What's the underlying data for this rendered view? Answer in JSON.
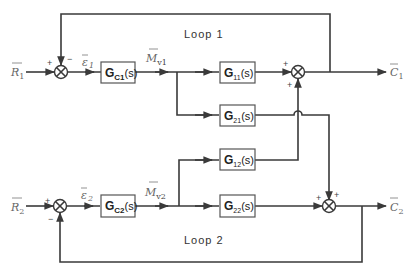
{
  "diagram": {
    "loops": [
      {
        "label": "Loop 1"
      },
      {
        "label": "Loop 2"
      }
    ],
    "inputs": [
      {
        "symbol": "R",
        "subscript": "1"
      },
      {
        "symbol": "R",
        "subscript": "2"
      }
    ],
    "outputs": [
      {
        "symbol": "C",
        "subscript": "1"
      },
      {
        "symbol": "C",
        "subscript": "2"
      }
    ],
    "errors": [
      {
        "symbol": "ε",
        "subscript": "1"
      },
      {
        "symbol": "ε",
        "subscript": "2"
      }
    ],
    "manipulated": [
      {
        "symbol": "M",
        "subscript": "v1"
      },
      {
        "symbol": "M",
        "subscript": "v2"
      }
    ],
    "blocks": [
      {
        "id": "gc1",
        "main": "G",
        "sub": "C1",
        "tail": "(s)"
      },
      {
        "id": "gc2",
        "main": "G",
        "sub": "C2",
        "tail": "(s)"
      },
      {
        "id": "g11",
        "main": "G",
        "sub": "11",
        "tail": "(s)"
      },
      {
        "id": "g21",
        "main": "G",
        "sub": "21",
        "tail": "(s)"
      },
      {
        "id": "g12",
        "main": "G",
        "sub": "12",
        "tail": "(s)"
      },
      {
        "id": "g22",
        "main": "G",
        "sub": "22",
        "tail": "(s)"
      }
    ],
    "signs": {
      "sum1_in": "+",
      "sum1_fb": "−",
      "sum2_in": "+",
      "sum2_fb": "−",
      "sum3_left": "+",
      "sum3_bottom": "+",
      "sum4_left": "+",
      "sum4_top": "+"
    },
    "colors": {
      "line": "#3a3a3a",
      "box_border": "#555555",
      "background": "#ffffff"
    }
  }
}
